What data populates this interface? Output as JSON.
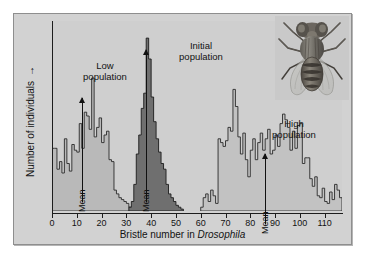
{
  "figure": {
    "background": "#d2d2d2",
    "plot_background": "#cfcfcf",
    "border_color": "#8e8e8e"
  },
  "axes": {
    "x_label_prefix": "Bristle number in ",
    "x_label_species": "Drosophila",
    "y_label": "Number of individuals",
    "y_label_arrow": "→",
    "x_ticks": [
      "0",
      "10",
      "20",
      "30",
      "40",
      "50",
      "60",
      "70",
      "80",
      "90",
      "100",
      "110"
    ],
    "x_tick_values": [
      0,
      10,
      20,
      30,
      40,
      50,
      60,
      70,
      80,
      90,
      100,
      110
    ]
  },
  "annotations": {
    "low": {
      "line1": "Low",
      "line2": "population",
      "mean_label": "Mean",
      "mean_value": 12
    },
    "initial": {
      "line1": "Initial",
      "line2": "population",
      "mean_label": "Mean",
      "mean_value": 38
    },
    "high": {
      "line1": "High",
      "line2": "population",
      "mean_label": "Mean",
      "mean_value": 86
    }
  },
  "illustration": {
    "name": "drosophila-fly",
    "caption": ""
  },
  "chart_data": {
    "type": "bar",
    "title": "",
    "xlabel": "Bristle number in Drosophila",
    "ylabel": "Number of individuals",
    "xlim": [
      0,
      117
    ],
    "ylim": [
      0,
      100
    ],
    "grid": false,
    "legend": false,
    "bin_width": 1,
    "series": [
      {
        "name": "Low population",
        "color": "#b9b9b9",
        "edge_color": "#2a2a2a",
        "mean": 12,
        "x": [
          0,
          1,
          2,
          3,
          4,
          5,
          6,
          7,
          8,
          9,
          10,
          11,
          12,
          13,
          14,
          15,
          16,
          17,
          18,
          19,
          20,
          21,
          22,
          23,
          24,
          25,
          26,
          27,
          28,
          29,
          30,
          31,
          32
        ],
        "values": [
          33,
          33,
          22,
          26,
          20,
          38,
          25,
          21,
          35,
          32,
          31,
          46,
          33,
          52,
          50,
          43,
          70,
          39,
          44,
          49,
          36,
          40,
          42,
          27,
          26,
          11,
          9,
          7,
          6,
          5,
          4,
          2,
          1
        ]
      },
      {
        "name": "Initial population",
        "color": "#6f6f6f",
        "edge_color": "#1c1c1c",
        "mean": 38,
        "x": [
          31,
          32,
          33,
          34,
          35,
          36,
          37,
          38,
          39,
          40,
          41,
          42,
          43,
          44,
          45,
          46,
          47,
          48,
          49,
          50,
          51,
          52
        ],
        "values": [
          2,
          5,
          14,
          30,
          40,
          54,
          62,
          91,
          80,
          60,
          47,
          38,
          31,
          25,
          22,
          14,
          9,
          7,
          5,
          3,
          2,
          1
        ]
      },
      {
        "name": "High population",
        "color": "#c2c2c2",
        "edge_color": "#2a2a2a",
        "mean": 86,
        "x": [
          60,
          61,
          62,
          63,
          64,
          65,
          66,
          67,
          68,
          69,
          70,
          71,
          72,
          73,
          74,
          75,
          76,
          77,
          78,
          79,
          80,
          81,
          82,
          83,
          84,
          85,
          86,
          87,
          88,
          89,
          90,
          91,
          92,
          93,
          94,
          95,
          96,
          97,
          98,
          99,
          100,
          101,
          102,
          103,
          104,
          105,
          106,
          107,
          108,
          109,
          110,
          111,
          112,
          113,
          114,
          115,
          116
        ],
        "values": [
          2,
          7,
          9,
          5,
          11,
          8,
          4,
          38,
          36,
          34,
          37,
          44,
          42,
          64,
          55,
          39,
          30,
          41,
          27,
          18,
          32,
          38,
          27,
          36,
          41,
          32,
          38,
          43,
          30,
          32,
          40,
          34,
          46,
          51,
          48,
          44,
          32,
          42,
          33,
          45,
          46,
          25,
          28,
          28,
          17,
          13,
          18,
          8,
          7,
          12,
          5,
          4,
          10,
          6,
          14,
          11,
          7
        ]
      }
    ]
  }
}
